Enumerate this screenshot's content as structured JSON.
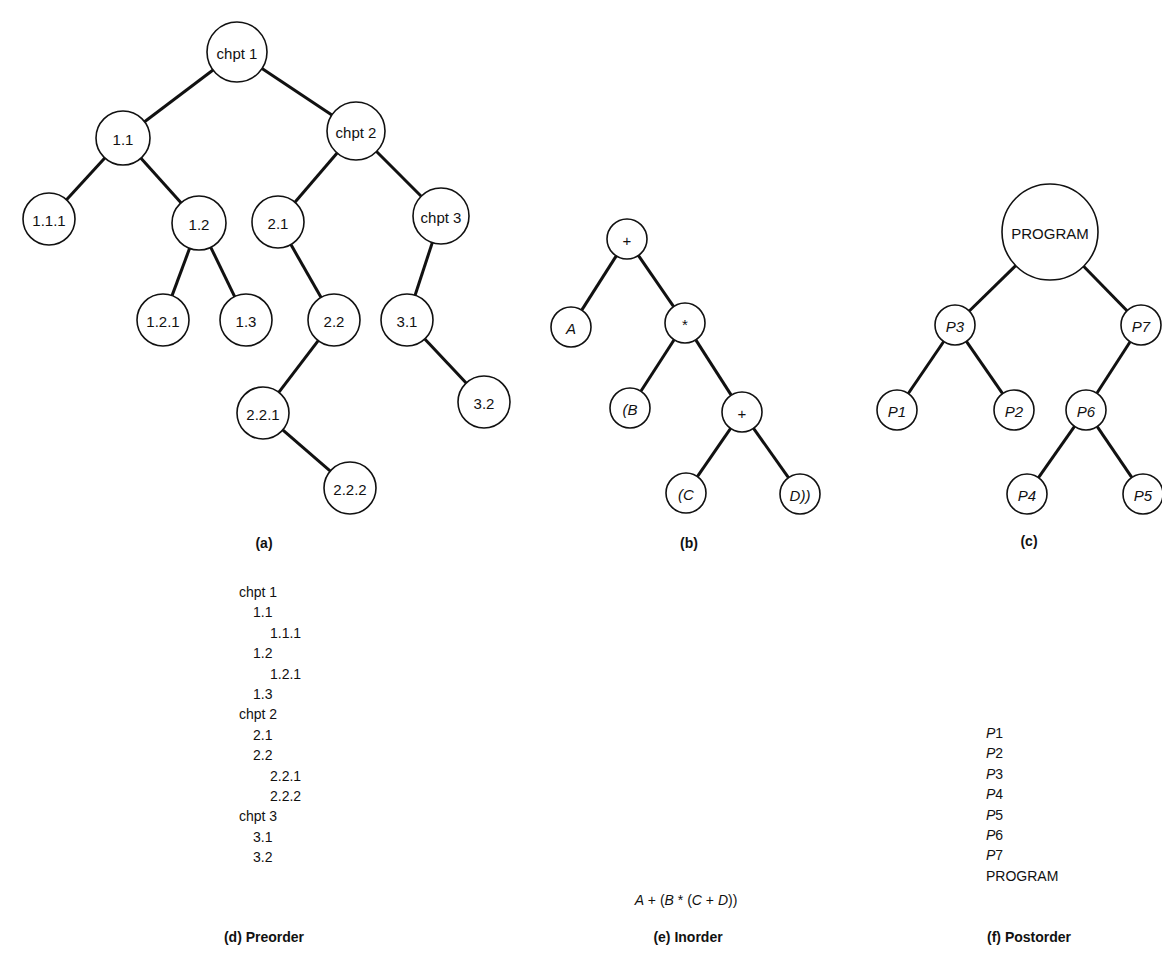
{
  "figure": {
    "trees": [
      {
        "id": "a",
        "caption": "(a)",
        "caption_pos": [
          264,
          544
        ],
        "nodes": [
          {
            "id": "chpt1",
            "label": "chpt 1",
            "x": 237,
            "y": 52,
            "r": 30,
            "italic": false
          },
          {
            "id": "n1_1",
            "label": "1.1",
            "x": 123,
            "y": 138,
            "r": 27,
            "italic": false
          },
          {
            "id": "chpt2",
            "label": "chpt 2",
            "x": 356,
            "y": 131,
            "r": 29,
            "italic": false
          },
          {
            "id": "n1_1_1",
            "label": "1.1.1",
            "x": 49,
            "y": 219,
            "r": 26,
            "italic": false
          },
          {
            "id": "n1_2",
            "label": "1.2",
            "x": 199,
            "y": 223,
            "r": 27,
            "italic": false
          },
          {
            "id": "n2_1",
            "label": "2.1",
            "x": 278,
            "y": 222,
            "r": 26,
            "italic": false
          },
          {
            "id": "chpt3",
            "label": "chpt 3",
            "x": 441,
            "y": 216,
            "r": 28,
            "italic": false
          },
          {
            "id": "n1_2_1",
            "label": "1.2.1",
            "x": 163,
            "y": 320,
            "r": 26,
            "italic": false
          },
          {
            "id": "n1_3",
            "label": "1.3",
            "x": 246,
            "y": 320,
            "r": 26,
            "italic": false
          },
          {
            "id": "n2_2",
            "label": "2.2",
            "x": 334,
            "y": 320,
            "r": 26,
            "italic": false
          },
          {
            "id": "n3_1",
            "label": "3.1",
            "x": 407,
            "y": 320,
            "r": 26,
            "italic": false
          },
          {
            "id": "n2_2_1",
            "label": "2.2.1",
            "x": 263,
            "y": 413,
            "r": 26,
            "italic": false
          },
          {
            "id": "n3_2",
            "label": "3.2",
            "x": 484,
            "y": 402,
            "r": 26,
            "italic": false
          },
          {
            "id": "n2_2_2",
            "label": "2.2.2",
            "x": 350,
            "y": 488,
            "r": 26,
            "italic": false
          }
        ],
        "edges": [
          [
            "chpt1",
            "n1_1"
          ],
          [
            "chpt1",
            "chpt2"
          ],
          [
            "n1_1",
            "n1_1_1"
          ],
          [
            "n1_1",
            "n1_2"
          ],
          [
            "n1_2",
            "n1_2_1"
          ],
          [
            "n1_2",
            "n1_3"
          ],
          [
            "chpt2",
            "n2_1"
          ],
          [
            "chpt2",
            "chpt3"
          ],
          [
            "n2_1",
            "n2_2"
          ],
          [
            "n2_2",
            "n2_2_1"
          ],
          [
            "n2_2_1",
            "n2_2_2"
          ],
          [
            "chpt3",
            "n3_1"
          ],
          [
            "n3_1",
            "n3_2"
          ]
        ]
      },
      {
        "id": "b",
        "caption": "(b)",
        "caption_pos": [
          689,
          544
        ],
        "nodes": [
          {
            "id": "plus1",
            "label": "+",
            "x": 627,
            "y": 239,
            "r": 20,
            "italic": false
          },
          {
            "id": "A",
            "label": "A",
            "x": 571,
            "y": 327,
            "r": 20,
            "italic": true
          },
          {
            "id": "star",
            "label": "*",
            "x": 685,
            "y": 323,
            "r": 20,
            "italic": false
          },
          {
            "id": "B",
            "label": "(B",
            "x": 630,
            "y": 408,
            "r": 20,
            "italic": true
          },
          {
            "id": "plus2",
            "label": "+",
            "x": 742,
            "y": 412,
            "r": 20,
            "italic": false
          },
          {
            "id": "C",
            "label": "(C",
            "x": 686,
            "y": 493,
            "r": 20,
            "italic": true
          },
          {
            "id": "D",
            "label": "D))",
            "x": 800,
            "y": 494,
            "r": 20,
            "italic": true
          }
        ],
        "edges": [
          [
            "plus1",
            "A"
          ],
          [
            "plus1",
            "star"
          ],
          [
            "star",
            "B"
          ],
          [
            "star",
            "plus2"
          ],
          [
            "plus2",
            "C"
          ],
          [
            "plus2",
            "D"
          ]
        ]
      },
      {
        "id": "c",
        "caption": "(c)",
        "caption_pos": [
          1029,
          542
        ],
        "nodes": [
          {
            "id": "PROGRAM",
            "label": "PROGRAM",
            "x": 1050,
            "y": 232,
            "r": 48,
            "italic": false
          },
          {
            "id": "P3",
            "label": "P3",
            "x": 955,
            "y": 325,
            "r": 20,
            "italic": true
          },
          {
            "id": "P7",
            "label": "P7",
            "x": 1141,
            "y": 325,
            "r": 20,
            "italic": true
          },
          {
            "id": "P1",
            "label": "P1",
            "x": 897,
            "y": 410,
            "r": 20,
            "italic": true
          },
          {
            "id": "P2",
            "label": "P2",
            "x": 1014,
            "y": 410,
            "r": 20,
            "italic": true
          },
          {
            "id": "P6",
            "label": "P6",
            "x": 1086,
            "y": 410,
            "r": 20,
            "italic": true
          },
          {
            "id": "P4",
            "label": "P4",
            "x": 1027,
            "y": 494,
            "r": 20,
            "italic": true
          },
          {
            "id": "P5",
            "label": "P5",
            "x": 1143,
            "y": 494,
            "r": 20,
            "italic": true
          }
        ],
        "edges": [
          [
            "PROGRAM",
            "P3"
          ],
          [
            "PROGRAM",
            "P7"
          ],
          [
            "P3",
            "P1"
          ],
          [
            "P3",
            "P2"
          ],
          [
            "P7",
            "P6"
          ],
          [
            "P6",
            "P4"
          ],
          [
            "P6",
            "P5"
          ]
        ]
      }
    ],
    "preorder": {
      "caption": "(d) Preorder",
      "caption_pos": [
        264,
        938
      ],
      "items": [
        {
          "text": "chpt 1",
          "indent": 0
        },
        {
          "text": "1.1",
          "indent": 1
        },
        {
          "text": "1.1.1",
          "indent": 2
        },
        {
          "text": "1.2",
          "indent": 1
        },
        {
          "text": "1.2.1",
          "indent": 2
        },
        {
          "text": "1.3",
          "indent": 1
        },
        {
          "text": "chpt 2",
          "indent": 0
        },
        {
          "text": "2.1",
          "indent": 1
        },
        {
          "text": "2.2",
          "indent": 1
        },
        {
          "text": "2.2.1",
          "indent": 2
        },
        {
          "text": "2.2.2",
          "indent": 2
        },
        {
          "text": "chpt 3",
          "indent": 0
        },
        {
          "text": "3.1",
          "indent": 1
        },
        {
          "text": "3.2",
          "indent": 1
        }
      ]
    },
    "inorder": {
      "caption": "(e) Inorder",
      "expression": "A + (B * (C + D))",
      "tokens": [
        {
          "t": "A",
          "i": true
        },
        {
          "t": " + (",
          "i": false
        },
        {
          "t": "B",
          "i": true
        },
        {
          "t": " * (",
          "i": false
        },
        {
          "t": "C",
          "i": true
        },
        {
          "t": " + ",
          "i": false
        },
        {
          "t": "D",
          "i": true
        },
        {
          "t": "))",
          "i": false
        }
      ]
    },
    "postorder": {
      "caption": "(f) Postorder",
      "items": [
        {
          "prefix": "P",
          "suffix": "1"
        },
        {
          "prefix": "P",
          "suffix": "2"
        },
        {
          "prefix": "P",
          "suffix": "3"
        },
        {
          "prefix": "P",
          "suffix": "4"
        },
        {
          "prefix": "P",
          "suffix": "5"
        },
        {
          "prefix": "P",
          "suffix": "6"
        },
        {
          "prefix": "P",
          "suffix": "7"
        },
        {
          "prefix": "",
          "suffix": "PROGRAM"
        }
      ]
    }
  }
}
